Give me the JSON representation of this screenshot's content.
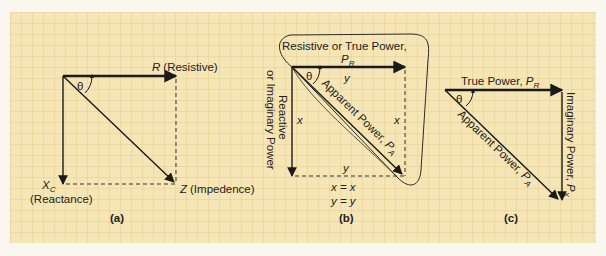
{
  "colors": {
    "paper": "#f6e6b6",
    "grid": "#e2c98d",
    "ink": "#1a1a1a",
    "margin": "#f9f7ef"
  },
  "diagrams": {
    "a": {
      "caption": "(a)",
      "theta": "θ",
      "r_label_main": "R",
      "r_label_desc": "(Resistive)",
      "xc_label_main": "X",
      "xc_label_sub": "C",
      "xc_label_desc": "(Reactance)",
      "z_label_main": "Z",
      "z_label_desc": "(Impedence)"
    },
    "b": {
      "caption": "(b)",
      "theta": "θ",
      "bubble_title": "Resistive or  True Power,",
      "pr_main": "P",
      "pr_sub": "R",
      "top_y": "y",
      "bottom_y": "y",
      "left_x": "x",
      "right_x": "x",
      "reactive_line1": "Reactive",
      "reactive_line2": "or Imaginary Power",
      "apparent_text": "Apparent Power, ",
      "pa_main": "P",
      "pa_sub": "A",
      "eq1": "x = x",
      "eq2": "y = y"
    },
    "c": {
      "caption": "(c)",
      "theta": "θ",
      "true_power_text": "True Power, ",
      "pr_main": "P",
      "pr_sub": "R",
      "apparent_text": "Apparent Power, ",
      "pa_main": "P",
      "pa_sub": "A",
      "imag_text": "Imaginary Power, ",
      "px_main": "P",
      "px_sub": "X"
    }
  }
}
